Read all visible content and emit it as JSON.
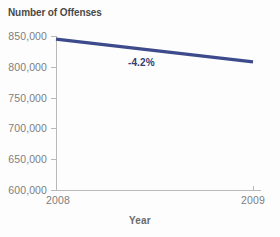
{
  "chart_data": {
    "type": "line",
    "title": "Number of Offenses",
    "xlabel": "Year",
    "ylabel": "Number of Offenses",
    "x": [
      "2008",
      "2009"
    ],
    "categories": [
      "2008",
      "2009"
    ],
    "series": [
      {
        "name": "Number of Offenses",
        "values": [
          845000,
          808000
        ],
        "color": "#3d4a8c"
      }
    ],
    "annotations": [
      {
        "text": "-4.2%",
        "x": 0.45,
        "y": 800000,
        "color": "#343e70"
      }
    ],
    "ylim": [
      600000,
      850000
    ],
    "ytick_values": [
      850000,
      800000,
      750000,
      700000,
      650000,
      600000
    ],
    "ytick_labels": [
      "850,000",
      "800,000",
      "750,000",
      "700,000",
      "650,000",
      "600,000"
    ],
    "xtick_labels": [
      "2008",
      "2009"
    ],
    "grid": false,
    "legend": false,
    "legend_position": "none"
  },
  "colors": {
    "line": "#3d4a8c",
    "annotation": "#343e70",
    "axis": "#b9b9b9",
    "tick_text": "#7d7d7d",
    "title_text": "#4a4a4a",
    "background": "#fdfdfd"
  }
}
